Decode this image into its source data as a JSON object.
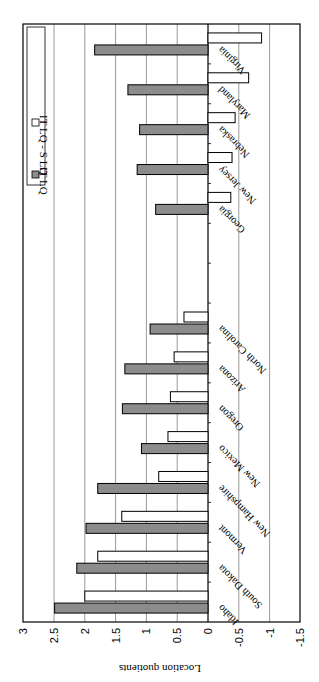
{
  "chart_data": {
    "type": "bar",
    "orientation": "rotated (rendered upside-down, value axis horizontal)",
    "title": "",
    "xlabel": "",
    "ylabel": "Location quotients",
    "ylim": [
      -1.5,
      3
    ],
    "yticks": [
      3,
      2.5,
      2,
      1.5,
      1,
      0.5,
      0,
      -0.5,
      -1,
      -1.5
    ],
    "ytick_labels": [
      "3",
      "2.5",
      "2",
      "1.5",
      "1",
      "0.5",
      "0",
      "-0.5",
      "-1",
      "-1.5"
    ],
    "grid": true,
    "legend_position": "top (rotated)",
    "categories": [
      "Idaho",
      "South Dakota",
      "Vermont",
      "New Hampshire",
      "New Mexico",
      "Oregon",
      "Arizona",
      "North Carolina",
      "",
      "",
      "Georgia",
      "New Jersey",
      "Nebraska",
      "Maryland",
      "Virginia"
    ],
    "series": [
      {
        "name": "IT LQ",
        "color": "#8c8c8c",
        "values": [
          2.49,
          2.13,
          1.98,
          1.79,
          1.08,
          1.39,
          1.35,
          0.94,
          null,
          null,
          0.85,
          1.15,
          1.11,
          1.3,
          1.84
        ]
      },
      {
        "name": "IT LQ - S LQ",
        "color": "#ffffff",
        "values": [
          2.0,
          1.79,
          1.4,
          0.8,
          0.65,
          0.61,
          0.55,
          0.39,
          null,
          null,
          -0.37,
          -0.39,
          -0.44,
          -0.66,
          -0.87
        ]
      }
    ]
  },
  "legend": {
    "items": [
      {
        "label": "IT LQ",
        "swatch": "#8c8c8c"
      },
      {
        "label": "IT LQ - S LQ",
        "swatch": "#ffffff"
      }
    ]
  },
  "axis": {
    "title": "Location quotients"
  }
}
